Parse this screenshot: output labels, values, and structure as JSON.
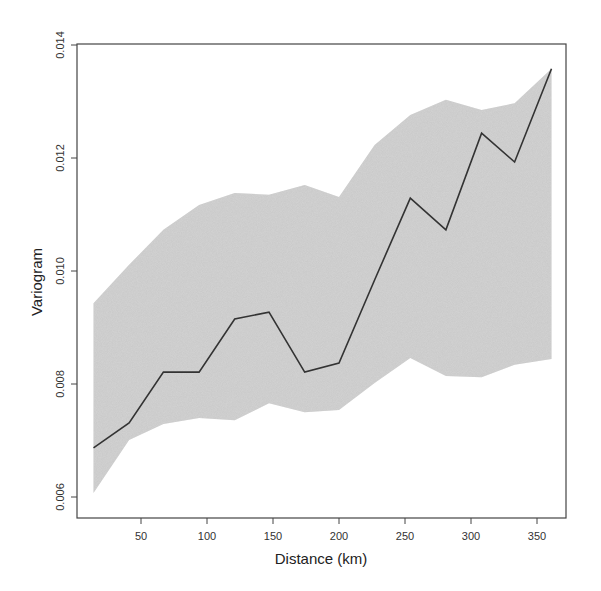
{
  "chart_data": {
    "type": "line",
    "title": "",
    "xlabel": "Distance (km)",
    "ylabel": "Variogram",
    "xlim": [
      5,
      375
    ],
    "ylim": [
      0.0057,
      0.0141
    ],
    "x_ticks": [
      50,
      100,
      150,
      200,
      250,
      300,
      350
    ],
    "y_ticks": [
      0.006,
      0.008,
      0.01,
      0.012,
      0.014
    ],
    "y_tick_labels": [
      "0.006",
      "0.008",
      "0.010",
      "0.012",
      "0.014"
    ],
    "grid": false,
    "legend": null,
    "x": [
      14,
      41,
      67,
      94,
      121,
      147,
      174,
      200,
      227,
      254,
      281,
      308,
      333,
      361
    ],
    "series": [
      {
        "name": "Empirical variogram",
        "type": "line",
        "color": "#333333",
        "values": [
          0.00687,
          0.00731,
          0.00821,
          0.00821,
          0.00915,
          0.00927,
          0.00821,
          0.00837,
          0.00984,
          0.01129,
          0.01073,
          0.01244,
          0.01193,
          0.01358
        ]
      },
      {
        "name": "Envelope upper",
        "type": "band-upper",
        "color": "#c8c8c8",
        "values": [
          0.00943,
          0.01011,
          0.01073,
          0.01117,
          0.01138,
          0.01135,
          0.01152,
          0.01131,
          0.01223,
          0.01276,
          0.01303,
          0.01285,
          0.01297,
          0.01358
        ]
      },
      {
        "name": "Envelope lower",
        "type": "band-lower",
        "color": "#c8c8c8",
        "values": [
          0.00607,
          0.00701,
          0.00729,
          0.0074,
          0.00736,
          0.00766,
          0.0075,
          0.00754,
          0.00802,
          0.00846,
          0.00814,
          0.00812,
          0.00834,
          0.00844
        ]
      }
    ]
  }
}
